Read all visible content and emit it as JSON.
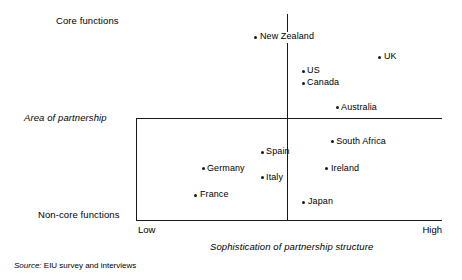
{
  "chart_data": {
    "type": "scatter",
    "title": "",
    "xlabel": "Sophistication of partnership structure",
    "ylabel": "Area of partnership",
    "xlim": [
      0,
      100
    ],
    "ylim": [
      0,
      100
    ],
    "grid": false,
    "legend": "none",
    "x_tick_labels": [
      "Low",
      "High"
    ],
    "y_tick_labels": [
      "Core functions",
      "Non-core functions"
    ],
    "y_mid_label": "Area of partnership",
    "x_axis_midline": 50,
    "y_axis_midline": 50,
    "points": [
      {
        "label": "New Zealand",
        "x": 39.2,
        "y": 88.8
      },
      {
        "label": "UK",
        "x": 79.7,
        "y": 79.1
      },
      {
        "label": "US",
        "x": 54.6,
        "y": 72.3
      },
      {
        "label": "Canada",
        "x": 54.6,
        "y": 66.5
      },
      {
        "label": "Australia",
        "x": 65.7,
        "y": 54.4
      },
      {
        "label": "South Africa",
        "x": 64.1,
        "y": 37.9
      },
      {
        "label": "Spain",
        "x": 41.2,
        "y": 33.0
      },
      {
        "label": "Germany",
        "x": 21.9,
        "y": 24.8
      },
      {
        "label": "Ireland",
        "x": 62.4,
        "y": 24.8
      },
      {
        "label": "Italy",
        "x": 41.2,
        "y": 20.4
      },
      {
        "label": "France",
        "x": 19.6,
        "y": 12.1
      },
      {
        "label": "Japan",
        "x": 54.9,
        "y": 8.7
      }
    ]
  },
  "labels": {
    "core_functions": "Core functions",
    "area_of_partnership": "Area of partnership",
    "non_core_functions": "Non-core functions",
    "low": "Low",
    "high": "High",
    "x_axis_title": "Sophistication of partnership structure"
  },
  "source": {
    "prefix": "Source:",
    "text": " EIU survey and interviews"
  },
  "colors": {
    "background": "#ffffff",
    "ink": "#1a1a1a",
    "axis": "#1a1a1a"
  }
}
